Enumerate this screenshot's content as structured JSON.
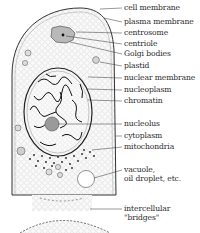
{
  "diagram": {
    "labels": [
      {
        "id": "cell-membrane",
        "text": "cell membrane",
        "x": 124,
        "y": 4,
        "px": 100,
        "py": 9
      },
      {
        "id": "plasma-membrane",
        "text": "plasma membrane",
        "x": 124,
        "y": 18,
        "px": 104,
        "py": 18
      },
      {
        "id": "centrosome",
        "text": "centrosome",
        "x": 124,
        "y": 29,
        "px": 76,
        "py": 32
      },
      {
        "id": "centriole",
        "text": "centriole",
        "x": 124,
        "y": 40,
        "px": 64,
        "py": 36
      },
      {
        "id": "golgi-bodies",
        "text": "Golgi bodies",
        "x": 124,
        "y": 50,
        "px": 70,
        "py": 42
      },
      {
        "id": "plastid",
        "text": "plastid",
        "x": 124,
        "y": 62,
        "px": 100,
        "py": 62
      },
      {
        "id": "nuclear-membrane",
        "text": "nuclear membrane",
        "x": 124,
        "y": 74,
        "px": 88,
        "py": 77
      },
      {
        "id": "nucleoplasm",
        "text": "nucleoplasm",
        "x": 124,
        "y": 86,
        "px": 86,
        "py": 89
      },
      {
        "id": "chromatin",
        "text": "chromatin",
        "x": 124,
        "y": 97,
        "px": 88,
        "py": 100
      },
      {
        "id": "nucleolus",
        "text": "nucleolus",
        "x": 124,
        "y": 120,
        "px": 60,
        "py": 123
      },
      {
        "id": "cytoplasm",
        "text": "cytoplasm",
        "x": 124,
        "y": 132,
        "px": 114,
        "py": 136
      },
      {
        "id": "mitochondria",
        "text": "mitochondria",
        "x": 124,
        "y": 143,
        "px": 92,
        "py": 150
      },
      {
        "id": "vacuole",
        "text": "vacuole,",
        "x": 124,
        "y": 166,
        "px": 98,
        "py": 178
      },
      {
        "id": "vacuole-2",
        "text": "oil droplet, etc.",
        "x": 124,
        "y": 175,
        "px": null,
        "py": null
      },
      {
        "id": "intercellular",
        "text": "intercellular",
        "x": 124,
        "y": 205,
        "px": 90,
        "py": 210
      },
      {
        "id": "intercellular-2",
        "text": "\"bridges\"",
        "x": 124,
        "y": 214,
        "px": null,
        "py": null
      }
    ]
  }
}
